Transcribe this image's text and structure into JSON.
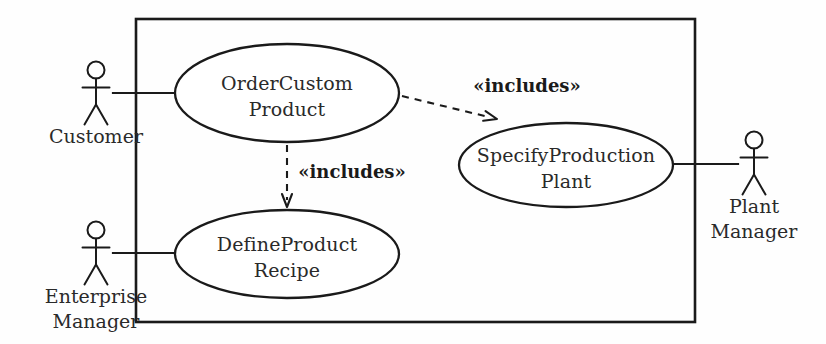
{
  "diagram": {
    "type": "uml-use-case-diagram",
    "background_color": "#fefefe",
    "line_color": "#1a1a1a",
    "text_color": "#2a2a2a",
    "system_boundary": {
      "label": "",
      "x": 136,
      "y": 19,
      "width": 559,
      "height": 303
    },
    "use_cases": [
      {
        "id": "order-custom-product",
        "line1": "OrderCustom",
        "line2": "Product",
        "cx": 287,
        "cy": 93,
        "rx": 112,
        "ry": 49
      },
      {
        "id": "specify-production-plant",
        "line1": "SpecifyProduction",
        "line2": "Plant",
        "cx": 566,
        "cy": 165,
        "rx": 107,
        "ry": 42
      },
      {
        "id": "define-product-recipe",
        "line1": "DefineProduct",
        "line2": "Recipe",
        "cx": 287,
        "cy": 254,
        "rx": 112,
        "ry": 44
      }
    ],
    "actors": [
      {
        "id": "customer",
        "line1": "Customer",
        "line2": "",
        "x": 96,
        "y": 70
      },
      {
        "id": "enterprise-manager",
        "line1": "Enterprise",
        "line2": "Manager",
        "x": 96,
        "y": 230
      },
      {
        "id": "plant-manager",
        "line1": "Plant",
        "line2": "Manager",
        "x": 754,
        "y": 140
      }
    ],
    "associations": [
      {
        "id": "customer-to-order-custom-product",
        "x1": 113,
        "y1": 93,
        "x2": 177,
        "y2": 93
      },
      {
        "id": "enterprise-manager-to-define-product-recipe",
        "x1": 113,
        "y1": 253,
        "x2": 177,
        "y2": 253
      },
      {
        "id": "plant-manager-to-specify-production-plant",
        "x1": 672,
        "y1": 164,
        "x2": 738,
        "y2": 164
      }
    ],
    "include_relations": [
      {
        "id": "order-custom-product-includes-specify-production-plant",
        "label": "«includes»",
        "from": "order-custom-product",
        "to": "specify-production-plant",
        "x1": 402,
        "y1": 96,
        "x2": 497,
        "y2": 119,
        "label_x": 527,
        "label_y": 92
      },
      {
        "id": "order-custom-product-includes-define-product-recipe",
        "label": "«includes»",
        "from": "order-custom-product",
        "to": "define-product-recipe",
        "x1": 287,
        "y1": 145,
        "x2": 287,
        "y2": 207,
        "label_x": 352,
        "label_y": 178
      }
    ]
  }
}
